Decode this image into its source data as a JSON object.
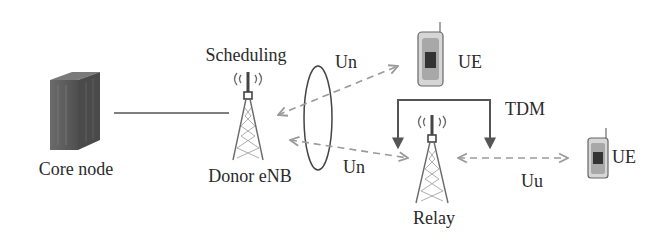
{
  "diagram": {
    "nodes": {
      "core_node": {
        "label": "Core node"
      },
      "donor_enb": {
        "label": "Donor eNB",
        "annotation": "Scheduling"
      },
      "relay": {
        "label": "Relay"
      },
      "ue_top": {
        "label": "UE"
      },
      "ue_right": {
        "label": "UE"
      }
    },
    "links": {
      "un_upper": {
        "label": "Un"
      },
      "un_lower": {
        "label": "Un"
      },
      "uu": {
        "label": "Uu"
      },
      "tdm": {
        "label": "TDM"
      }
    },
    "colors": {
      "text": "#2a2a2a",
      "line": "#555555",
      "dashed_arrow": "#9a9a9a",
      "server": "#5f5f5f",
      "tower": "#6a6a6a"
    }
  }
}
